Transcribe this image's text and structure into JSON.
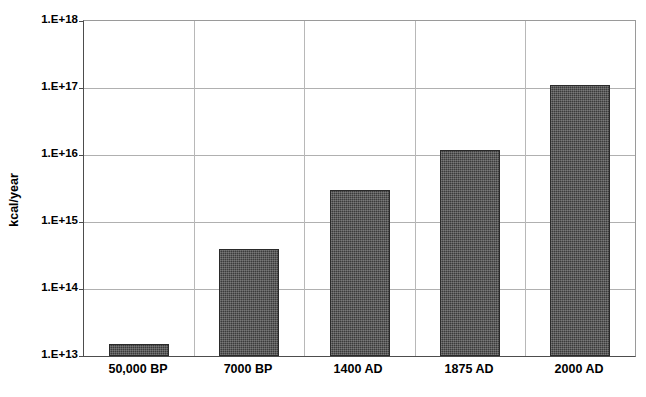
{
  "chart_data": {
    "type": "bar",
    "title": "",
    "subtitle": "",
    "xlabel": "",
    "ylabel": "kcal/year",
    "categories": [
      "50,000 BP",
      "7000 BP",
      "1400 AD",
      "1875 AD",
      "2000 AD"
    ],
    "values": [
      15000000000000.0,
      400000000000000.0,
      3000000000000000.0,
      1.2e+16,
      1.1e+17
    ],
    "value_labels": [
      "1.5E+13",
      "4.0E+14",
      "3.0E+15",
      "1.2E+16",
      "1.1E+17"
    ],
    "yscale": "log",
    "ylim": [
      10000000000000.0,
      1e+18
    ],
    "ytick_labels": [
      "1.E+18",
      "1.E+17",
      "1.E+16",
      "1.E+15",
      "1.E+14",
      "1.E+13"
    ],
    "ytick_values": [
      1e+18,
      1e+17,
      1e+16,
      1000000000000000.0,
      100000000000000.0,
      10000000000000.0
    ],
    "grid": "horizontal-and-vertical",
    "legend": "none",
    "bar_color": "#3b3b3b",
    "gridline_color": "#b0b0b0",
    "axis_color": "#4d4d4d",
    "background_color": "#ffffff",
    "series": [
      {
        "name": "Energy use",
        "values": [
          15000000000000.0,
          400000000000000.0,
          3000000000000000.0,
          1.2e+16,
          1.1e+17
        ]
      }
    ]
  }
}
